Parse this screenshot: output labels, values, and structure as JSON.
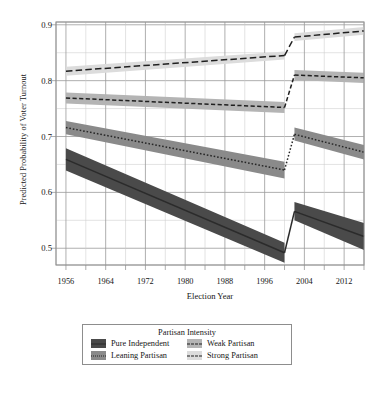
{
  "chart_data": {
    "type": "line",
    "title": "",
    "xlabel": "Election Year",
    "ylabel": "Predicted Probability of Voter Turnout",
    "xlim": [
      1954,
      2016
    ],
    "ylim": [
      0.47,
      0.905
    ],
    "xticks": [
      1956,
      1964,
      1972,
      1980,
      1988,
      1996,
      2004,
      2012
    ],
    "xticklabels": [
      "1956",
      "1964",
      "1972",
      "1980",
      "1988",
      "1996",
      "2004",
      "2012"
    ],
    "xminor_step": 4,
    "yticks": [
      0.5,
      0.6,
      0.7,
      0.8,
      0.9
    ],
    "yticklabels": [
      "0.5",
      "0.6",
      "0.7",
      "0.8",
      "0.9"
    ],
    "yminor_step": 0.05,
    "grid": true,
    "legend_position": "below-center",
    "legend_title": "Partisan Intensity",
    "break_year": 2001,
    "series": [
      {
        "name": "Pure Independent",
        "color": "#2b2b2b",
        "band_color": "#4a4a4a",
        "dash": "solid",
        "segments": [
          {
            "x": [
              1956,
              2000
            ],
            "y": [
              0.659,
              0.492
            ],
            "ylow": [
              0.639,
              0.474
            ],
            "yhigh": [
              0.679,
              0.51
            ]
          },
          {
            "x": [
              2002,
              2016
            ],
            "y": [
              0.566,
              0.521
            ],
            "ylow": [
              0.55,
              0.497
            ],
            "yhigh": [
              0.583,
              0.545
            ]
          }
        ]
      },
      {
        "name": "Leaning Partisan",
        "color": "#262626",
        "band_color": "#8a8a8a",
        "dash": "dotted",
        "segments": [
          {
            "x": [
              1956,
              2000
            ],
            "y": [
              0.716,
              0.64
            ],
            "ylow": [
              0.704,
              0.625
            ],
            "yhigh": [
              0.728,
              0.655
            ]
          },
          {
            "x": [
              2002,
              2016
            ],
            "y": [
              0.704,
              0.672
            ],
            "ylow": [
              0.693,
              0.659
            ],
            "yhigh": [
              0.716,
              0.685
            ]
          }
        ]
      },
      {
        "name": "Weak Partisan",
        "color": "#1f1f1f",
        "band_color": "#b4b4b4",
        "dash": "dashed",
        "segments": [
          {
            "x": [
              1956,
              2000
            ],
            "y": [
              0.769,
              0.752
            ],
            "ylow": [
              0.759,
              0.742
            ],
            "yhigh": [
              0.779,
              0.762
            ]
          },
          {
            "x": [
              2002,
              2016
            ],
            "y": [
              0.81,
              0.805
            ],
            "ylow": [
              0.801,
              0.796
            ],
            "yhigh": [
              0.819,
              0.814
            ]
          }
        ]
      },
      {
        "name": "Strong Partisan",
        "color": "#1f1f1f",
        "band_color": "#dcdcdc",
        "dash": "longdash",
        "segments": [
          {
            "x": [
              1956,
              2000
            ],
            "y": [
              0.817,
              0.845
            ],
            "ylow": [
              0.809,
              0.838
            ],
            "yhigh": [
              0.825,
              0.852
            ]
          },
          {
            "x": [
              2002,
              2016
            ],
            "y": [
              0.878,
              0.889
            ],
            "ylow": [
              0.871,
              0.882
            ],
            "yhigh": [
              0.885,
              0.896
            ]
          }
        ]
      }
    ]
  },
  "axes": {
    "ylabel": "Predicted Probability of Voter Turnout",
    "xlabel": "Election Year"
  },
  "legend": {
    "title": "Partisan Intensity",
    "items": [
      {
        "label": "Pure Independent"
      },
      {
        "label": "Weak Partisan"
      },
      {
        "label": "Leaning Partisan"
      },
      {
        "label": "Strong Partisan"
      }
    ]
  }
}
